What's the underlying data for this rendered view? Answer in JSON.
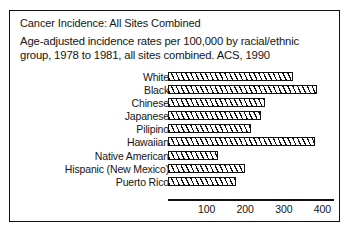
{
  "figure": {
    "title": "Cancer Incidence: All Sites Combined",
    "subtitle": "Age-adjusted incidence rates per 100,000 by racial/ethnic group, 1978 to 1981, all sites combined.  ACS, 1990",
    "frame_color": "#111111",
    "bar_outline_color": "#111111",
    "bar_fill": "diagonal-hatch"
  },
  "chart_data": {
    "type": "bar",
    "orientation": "horizontal",
    "title": "Cancer Incidence: All Sites Combined",
    "subtitle": "Age-adjusted incidence rates per 100,000 by racial/ethnic group, 1978 to 1981, all sites combined.  ACS, 1990",
    "xlabel": "",
    "ylabel": "",
    "xlim": [
      0,
      430
    ],
    "grid": false,
    "legend": "none",
    "xticks": [
      100,
      200,
      300,
      400
    ],
    "xtick_labels": [
      "100",
      "200",
      "300",
      "400"
    ],
    "categories": [
      "White",
      "Black",
      "Chinese",
      "Japanese",
      "Pilipino",
      "Hawaiian",
      "Native American",
      "Hispanic (New Mexico)",
      "Puerto Rico"
    ],
    "values": [
      325,
      385,
      250,
      240,
      215,
      380,
      130,
      200,
      176
    ]
  }
}
